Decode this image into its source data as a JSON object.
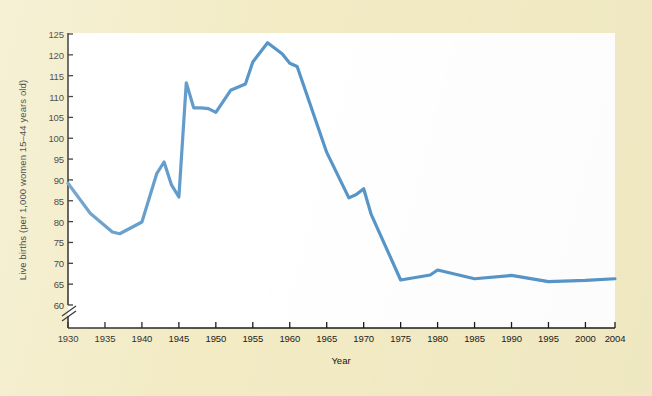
{
  "figure": {
    "background_color": "#f2ebc4",
    "panel_color": "#ffffff",
    "axis_color": "#1b1b1b",
    "line_color": "#5795c8"
  },
  "chart_data": {
    "type": "line",
    "title": "",
    "subtitle": "",
    "xlabel": "Year",
    "ylabel": "Live births (per 1,000 women 15–44 years old)",
    "xlim": [
      1930,
      2004
    ],
    "ylim": [
      58,
      125
    ],
    "axis_break": true,
    "axis_break_note": "y-axis broken below 60",
    "grid": false,
    "legend": null,
    "xticks": [
      1930,
      1935,
      1940,
      1945,
      1950,
      1955,
      1960,
      1965,
      1970,
      1975,
      1980,
      1985,
      1990,
      1995,
      2000,
      2004
    ],
    "xtick_labels": [
      "1930",
      "1935",
      "1940",
      "1945",
      "1950",
      "1955",
      "1960",
      "1965",
      "1970",
      "1975",
      "1980",
      "1985",
      "1990",
      "1995",
      "2000",
      "2004"
    ],
    "yticks": [
      60,
      65,
      70,
      75,
      80,
      85,
      90,
      95,
      100,
      105,
      110,
      115,
      120,
      125
    ],
    "ytick_labels": [
      "60",
      "65",
      "70",
      "75",
      "80",
      "85",
      "90",
      "95",
      "100",
      "105",
      "110",
      "115",
      "120",
      "125"
    ],
    "series": [
      {
        "name": "Live births per 1,000 women aged 15-44",
        "color": "#5795c8",
        "x": [
          1930,
          1933,
          1936,
          1937,
          1940,
          1942,
          1943,
          1944,
          1945,
          1946,
          1947,
          1948,
          1949,
          1950,
          1952,
          1954,
          1955,
          1957,
          1959,
          1960,
          1961,
          1965,
          1968,
          1969,
          1970,
          1971,
          1975,
          1979,
          1980,
          1985,
          1990,
          1995,
          2000,
          2004
        ],
        "y": [
          89.2,
          82.0,
          77.5,
          77.1,
          79.9,
          91.5,
          94.3,
          88.8,
          85.9,
          113.3,
          107.3,
          107.3,
          107.1,
          106.2,
          111.5,
          113.0,
          118.3,
          122.9,
          120.2,
          118.0,
          117.2,
          96.6,
          85.7,
          86.5,
          87.9,
          81.8,
          66.0,
          67.2,
          68.4,
          66.3,
          67.1,
          65.6,
          65.9,
          66.3
        ]
      }
    ],
    "annotations": []
  }
}
